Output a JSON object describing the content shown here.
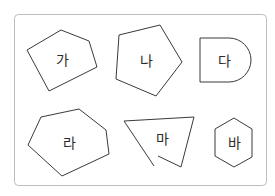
{
  "figure": {
    "frame": {
      "x": 14,
      "y": 14,
      "width": 253,
      "height": 172,
      "radius": 4,
      "stroke": "#bdbdbd"
    },
    "shapes": [
      {
        "id": "ga",
        "label": "가",
        "type": "pentagon",
        "points": "27,50 61,30 89,41 97,67 49,91",
        "label_pos": [
          62,
          60
        ]
      },
      {
        "id": "na",
        "label": "나",
        "type": "pentagon",
        "points": "119,35 160,25 182,62 156,96 116,79",
        "label_pos": [
          146,
          61
        ]
      },
      {
        "id": "da",
        "label": "다",
        "type": "rectangle-with-semicircle",
        "label_pos": [
          224,
          61
        ]
      },
      {
        "id": "ra",
        "label": "라",
        "type": "hexagon",
        "points": "41,117 79,109 106,130 109,154 62,176 28,145",
        "label_pos": [
          69,
          143
        ]
      },
      {
        "id": "ma",
        "label": "마",
        "type": "open-figure",
        "points": "154,166 124,121 194,117 181,167 158,156",
        "label_pos": [
          162,
          139
        ]
      },
      {
        "id": "ba",
        "label": "바",
        "type": "hexagon",
        "points": "234,118 252,129 252,157 234,167 215,156 215,129",
        "label_pos": [
          234,
          143
        ]
      }
    ]
  }
}
